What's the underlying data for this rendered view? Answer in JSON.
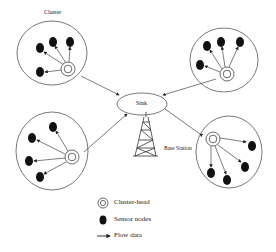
{
  "diagram": {
    "title_label": "Cluster",
    "sink_label": "Sink",
    "base_station_label": "Base Station",
    "colors": {
      "stroke": "#444444",
      "node": "#111111",
      "background": "#ffffff"
    },
    "clusters": [
      {
        "id": "top-left",
        "head": [
          68,
          69
        ],
        "nodes": [
          [
            40,
            48
          ],
          [
            53,
            42
          ],
          [
            70,
            42
          ],
          [
            40,
            72
          ]
        ]
      },
      {
        "id": "top-right",
        "head": [
          227,
          74
        ],
        "nodes": [
          [
            207,
            46
          ],
          [
            221,
            42
          ],
          [
            240,
            42
          ],
          [
            200,
            65
          ]
        ]
      },
      {
        "id": "bottom-left",
        "head": [
          72,
          157
        ],
        "nodes": [
          [
            53,
            127
          ],
          [
            32,
            138
          ],
          [
            29,
            161
          ],
          [
            40,
            177
          ]
        ]
      },
      {
        "id": "bottom-right",
        "head": [
          213,
          139
        ],
        "nodes": [
          [
            252,
            146
          ],
          [
            245,
            167
          ],
          [
            227,
            180
          ],
          [
            211,
            173
          ]
        ]
      }
    ]
  },
  "legend": {
    "items": [
      {
        "icon": "cluster-head-icon",
        "label": "Cluster-head"
      },
      {
        "icon": "sensor-node-icon",
        "label": "Sensor nodes"
      },
      {
        "icon": "arrow-icon",
        "label": "Flow data"
      }
    ]
  }
}
